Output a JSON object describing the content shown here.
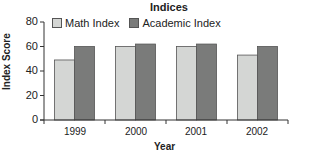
{
  "chart_data": {
    "type": "bar",
    "title": "Indices",
    "xlabel": "Year",
    "ylabel": "Index Score",
    "categories": [
      "1999",
      "2000",
      "2001",
      "2002"
    ],
    "series": [
      {
        "name": "Math Index",
        "color": "#d4d6d4",
        "values": [
          49,
          60,
          60,
          53
        ]
      },
      {
        "name": "Academic Index",
        "color": "#7a7b7a",
        "values": [
          60,
          62,
          62,
          60
        ]
      }
    ],
    "ylim": [
      0,
      80
    ],
    "yticks": [
      "0",
      "20",
      "40",
      "60",
      "80"
    ],
    "grid": false,
    "legend_position": "top-inside"
  }
}
